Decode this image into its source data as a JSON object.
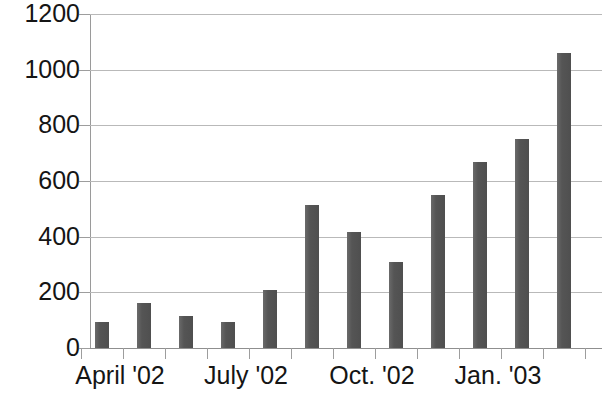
{
  "chart_data": {
    "type": "bar",
    "title": "",
    "subtitle": "",
    "xlabel": "",
    "ylabel": "",
    "ylim": [
      0,
      1200
    ],
    "y_ticks": [
      0,
      200,
      400,
      600,
      800,
      1000,
      1200
    ],
    "y_tick_labels": [
      "0",
      "200",
      "400",
      "600",
      "800",
      "1000",
      "1200"
    ],
    "grid": true,
    "legend": null,
    "legend_position": "none",
    "categories": [
      "April '02",
      "May '02",
      "June '02",
      "July '02",
      "Aug. '02",
      "Sept. '02",
      "Oct. '02",
      "Nov. '02",
      "Dec. '02",
      "Jan. '03",
      "Feb. '03",
      "Mar. '03"
    ],
    "x_tick_labels_visible": [
      "April '02",
      "July '02",
      "Oct. '02",
      "Jan. '03"
    ],
    "values": [
      93,
      162,
      115,
      93,
      208,
      514,
      417,
      310,
      550,
      668,
      752,
      1060
    ],
    "bar_color": "#595959",
    "gridline_color": "#b9b9b9",
    "axis_color": "#9a9a9a",
    "background_color": "#ffffff"
  },
  "axis": {
    "y_labels": [
      "1200",
      "1000",
      "800",
      "600",
      "400",
      "200",
      "0"
    ],
    "x_labels": [
      {
        "text": "April '02",
        "x": 120
      },
      {
        "text": "July '02",
        "x": 246
      },
      {
        "text": "Oct. '02",
        "x": 372
      },
      {
        "text": "Jan. '03",
        "x": 498
      }
    ]
  }
}
